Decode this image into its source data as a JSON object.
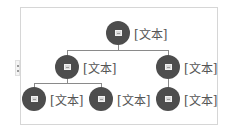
{
  "diagram": {
    "type": "hierarchy",
    "root": {
      "label": "[文本]",
      "icon": "picture-placeholder-icon"
    },
    "level2": [
      {
        "label": "[文本]",
        "icon": "picture-placeholder-icon"
      },
      {
        "label": "[文本]",
        "icon": "picture-placeholder-icon"
      }
    ],
    "level3": [
      {
        "label": "[文本]",
        "parent": 0,
        "icon": "picture-placeholder-icon"
      },
      {
        "label": "[文本]",
        "parent": 0,
        "icon": "picture-placeholder-icon"
      },
      {
        "label": "[文本]",
        "parent": 1,
        "icon": "picture-placeholder-icon"
      }
    ],
    "colors": {
      "circle": "#4d4d4d",
      "connector": "#8a8a8a",
      "text": "#555555",
      "frame_border": "#d6d6d6"
    }
  }
}
